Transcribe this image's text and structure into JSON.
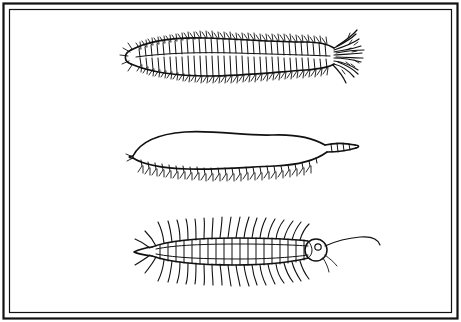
{
  "figure": {
    "title": "",
    "caption": "",
    "background_color": "#ffffff",
    "ink_color": "#111111",
    "border": {
      "name": "double-rule-frame",
      "outer_stroke_width": 2.2,
      "inner_stroke_width": 1.2
    },
    "specimens": [
      {
        "id": "specimen-top",
        "label": "",
        "description": "Elongate segmented worm with dense paired lateral bristle tufts along entire body and a tufted posterior end at the right",
        "orientation": "head-left",
        "segment_count": 34
      },
      {
        "id": "specimen-middle",
        "label": "",
        "description": "Smooth-backed segmented worm with short paired ventral appendages along the lower margin and a tapered tail at the right",
        "orientation": "head-left",
        "segment_count": 26
      },
      {
        "id": "specimen-bottom",
        "label": "",
        "description": "Centipede-like arthropod with a rounded head and eye at the right, long paired legs along the body, and a long trailing terminal filament",
        "orientation": "head-right",
        "segment_count": 20
      }
    ]
  }
}
